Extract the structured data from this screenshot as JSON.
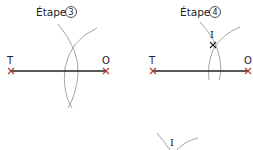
{
  "diagram": {
    "panels": [
      {
        "title": "Étape",
        "step_number": "3",
        "points": {
          "left": "T",
          "right": "O"
        }
      },
      {
        "title": "Étape",
        "step_number": "4",
        "points": {
          "left": "T",
          "right": "O",
          "intersection": "I"
        }
      }
    ],
    "bottom_fragment": {
      "label": "I"
    },
    "colors": {
      "segment": "#222222",
      "arc": "#9a9a9a",
      "text": "#222222"
    }
  }
}
